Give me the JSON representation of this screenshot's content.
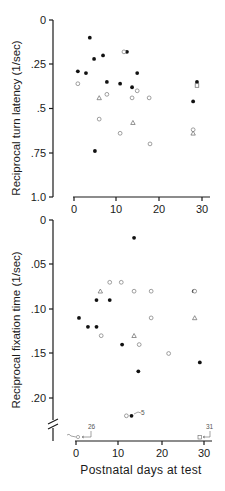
{
  "chart_data": [
    {
      "type": "scatter",
      "title": "",
      "xlabel": "",
      "ylabel": "Reciprocal turn latency (1/sec)",
      "xlim": [
        0,
        31
      ],
      "ylim": [
        1.0,
        0
      ],
      "y_inverted": true,
      "x_ticks": [
        "0",
        "10",
        "20",
        "30"
      ],
      "y_ticks": [
        "0",
        ".25",
        ".5",
        ".75",
        "1.0"
      ],
      "grid": false,
      "legend": null,
      "series": [
        {
          "name": "filled-circle",
          "marker": "filled-circle",
          "points": [
            [
              3.7,
              0.1
            ],
            [
              4.7,
              0.22
            ],
            [
              6.8,
              0.2
            ],
            [
              0.9,
              0.29
            ],
            [
              2.8,
              0.3
            ],
            [
              12.4,
              0.18
            ],
            [
              14.8,
              0.3
            ],
            [
              7.7,
              0.35
            ],
            [
              10.8,
              0.36
            ],
            [
              13.6,
              0.38
            ],
            [
              28.8,
              0.35
            ],
            [
              27.9,
              0.46
            ],
            [
              4.9,
              0.74
            ]
          ]
        },
        {
          "name": "open-circle",
          "marker": "open-circle",
          "points": [
            [
              0.9,
              0.36
            ],
            [
              11.7,
              0.18
            ],
            [
              7.7,
              0.42
            ],
            [
              14.8,
              0.4
            ],
            [
              13.6,
              0.44
            ],
            [
              17.6,
              0.44
            ],
            [
              5.9,
              0.56
            ],
            [
              10.8,
              0.64
            ],
            [
              17.8,
              0.7
            ],
            [
              27.9,
              0.62
            ]
          ]
        },
        {
          "name": "open-square",
          "marker": "open-square",
          "points": [
            [
              28.8,
              0.37
            ]
          ]
        },
        {
          "name": "open-triangle",
          "marker": "open-triangle",
          "points": [
            [
              5.9,
              0.44
            ],
            [
              13.8,
              0.58
            ],
            [
              27.9,
              0.64
            ]
          ]
        }
      ]
    },
    {
      "type": "scatter",
      "title": "",
      "xlabel": "Postnatal days at test",
      "ylabel": "Reciprocal fixation time (1/sec)",
      "xlim": [
        0,
        31
      ],
      "ylim": [
        0.23,
        0
      ],
      "y_inverted": true,
      "axis_break": true,
      "x_ticks": [
        "0",
        "10",
        "20",
        "30"
      ],
      "y_ticks": [
        "0",
        ".05",
        ".10",
        ".15",
        ".20"
      ],
      "grid": false,
      "legend": null,
      "series": [
        {
          "name": "filled-circle",
          "marker": "filled-circle",
          "points": [
            [
              13.6,
              0.02
            ],
            [
              4.8,
              0.09
            ],
            [
              7.9,
              0.09
            ],
            [
              0.7,
              0.11
            ],
            [
              2.8,
              0.12
            ],
            [
              4.8,
              0.12
            ],
            [
              10.8,
              0.14
            ],
            [
              14.6,
              0.17
            ],
            [
              27.6,
              0.08
            ],
            [
              29.0,
              0.16
            ],
            [
              13.0,
              0.22
            ]
          ]
        },
        {
          "name": "open-circle",
          "marker": "open-circle",
          "points": [
            [
              7.9,
              0.07
            ],
            [
              10.6,
              0.07
            ],
            [
              13.6,
              0.08
            ],
            [
              17.6,
              0.08
            ],
            [
              5.9,
              0.13
            ],
            [
              14.8,
              0.14
            ],
            [
              17.6,
              0.11
            ],
            [
              21.7,
              0.15
            ],
            [
              27.8,
              0.08
            ],
            [
              11.8,
              0.22
            ]
          ]
        },
        {
          "name": "open-triangle",
          "marker": "open-triangle",
          "points": [
            [
              5.7,
              0.08
            ],
            [
              13.6,
              0.13
            ],
            [
              27.8,
              0.11
            ]
          ]
        }
      ],
      "off_scale_annotations": [
        {
          "label": "5",
          "x": 13.0,
          "marker": "filled-circle"
        },
        {
          "label": "26",
          "x": 1.0,
          "marker": "open-circle"
        },
        {
          "label": "31",
          "x": 29.0,
          "marker": "open-square"
        }
      ]
    }
  ],
  "top": {
    "ylabel": "Reciprocal turn latency (1/sec)",
    "yticks": [
      "0",
      ".25",
      ".5",
      ".75",
      "1.0"
    ],
    "xticks": [
      "0",
      "10",
      "20",
      "30"
    ]
  },
  "bottom": {
    "ylabel": "Reciprocal fixation time (1/sec)",
    "yticks": [
      "0",
      ".05",
      ".10",
      ".15",
      ".20"
    ],
    "xticks": [
      "0",
      "10",
      "20",
      "30"
    ],
    "xlabel": "Postnatal days at test",
    "annotations": {
      "five": "5",
      "twentysix": "26",
      "thirtyone": "31"
    }
  }
}
